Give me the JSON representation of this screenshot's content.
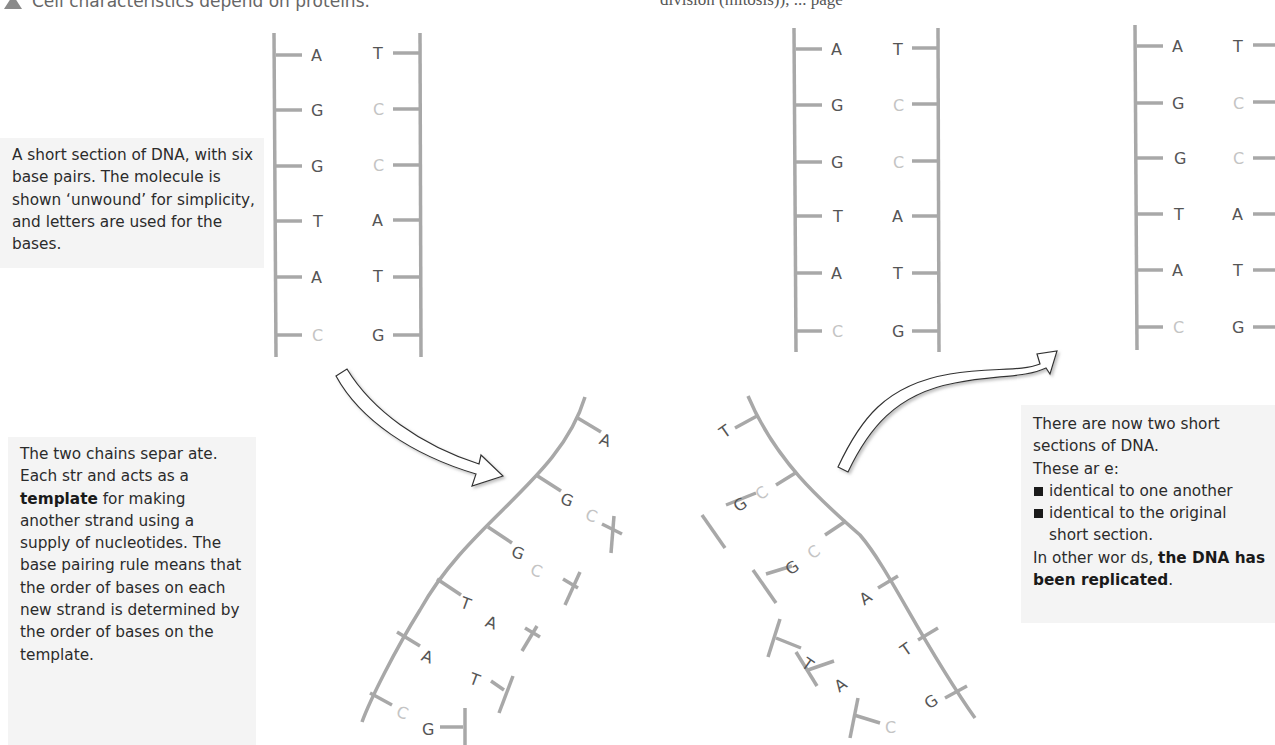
{
  "header": {
    "left_caption": "Cell characteristics depend on proteins.",
    "right_caption_fragment": "division (mitosis)), ... page"
  },
  "captions": {
    "original": "A short section of DNA, with six base pairs. The molecule is shown ‘unwound’ for simplicity, and letters are used for the bases.",
    "separation": {
      "part1": "The two chains separ ate. Each str and acts as a ",
      "bold": "template",
      "part2": " for making another strand using a supply of nucleotides. The base pairing rule means that the order of bases on each new strand is determined by the order of bases on the template."
    },
    "result": {
      "line1": "There are now two short sections of DNA.",
      "line2": "These ar e:",
      "bullets": [
        "identical to one another",
        "identical to the original short section."
      ],
      "conclusion_prefix": "In other wor ds, ",
      "conclusion_bold": "the DNA has been replicated",
      "conclusion_suffix": "."
    }
  },
  "dna": {
    "left_strand": [
      "A",
      "G",
      "G",
      "T",
      "A",
      "C"
    ],
    "right_strand": [
      "T",
      "C",
      "C",
      "A",
      "T",
      "G"
    ],
    "light_base": "C",
    "colors": {
      "backbone": "#a8a8a8",
      "base": "#555555",
      "cytosine": "#c4c4c4",
      "textbox_bg": "#f4f4f4"
    }
  },
  "diagram": {
    "stages": [
      "original-dna",
      "separating-strands",
      "two-copies"
    ],
    "arrows": [
      "arrow-to-separation",
      "arrow-to-replicated"
    ]
  }
}
